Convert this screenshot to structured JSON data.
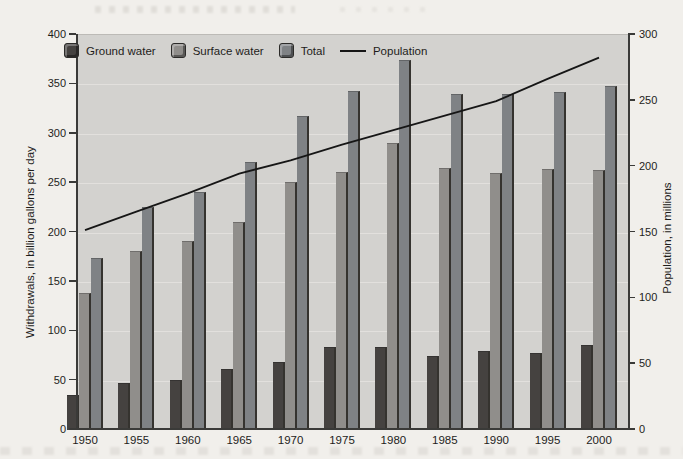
{
  "colors": {
    "ground": "#454240",
    "surface": "#908e8b",
    "total": "#7f8285",
    "bar_edge": "#35332f",
    "population_line": "#161616",
    "plot_background": "#d3d2cf",
    "page_background": "#f1efeb",
    "grid": "#e2e0dd",
    "axis": "#3a3a38",
    "text": "#1e1d1b"
  },
  "legend": [
    {
      "label": "Ground water",
      "swatch": "ground"
    },
    {
      "label": "Surface water",
      "swatch": "surface"
    },
    {
      "label": "Total",
      "swatch": "total"
    },
    {
      "label": "Population",
      "swatch": "line"
    }
  ],
  "chart_data": {
    "type": "bar",
    "categories": [
      "1950",
      "1955",
      "1960",
      "1965",
      "1970",
      "1975",
      "1980",
      "1985",
      "1990",
      "1995",
      "2000"
    ],
    "series": [
      {
        "name": "Ground water",
        "key": "ground",
        "values": [
          34,
          47,
          50,
          61,
          68,
          83,
          83,
          74,
          79,
          77,
          85
        ]
      },
      {
        "name": "Surface water",
        "key": "surface",
        "values": [
          138,
          180,
          190,
          210,
          250,
          260,
          290,
          264,
          259,
          263,
          262
        ]
      },
      {
        "name": "Total",
        "key": "total",
        "values": [
          173,
          225,
          240,
          270,
          317,
          342,
          374,
          339,
          339,
          341,
          347
        ]
      }
    ],
    "line_series": {
      "name": "Population",
      "axis": "right",
      "values": [
        151,
        165,
        179,
        194,
        204,
        216,
        227,
        238,
        249,
        266,
        282
      ]
    },
    "left_axis": {
      "label": "Withdrawals, in billion gallons per day",
      "min": 0,
      "max": 400,
      "step": 50
    },
    "right_axis": {
      "label": "Population, in millions",
      "min": 0,
      "max": 300,
      "step": 50
    },
    "grid": true,
    "legend_position": "top-left-inside"
  }
}
